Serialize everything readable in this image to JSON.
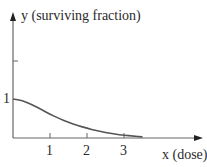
{
  "chart_data": {
    "type": "line",
    "title": "",
    "xlabel": "x (dose)",
    "ylabel": "y (surviving fraction)",
    "x_ticks": [
      "1",
      "2",
      "3"
    ],
    "y_ticks": [
      "1"
    ],
    "xlim": [
      0,
      5.2
    ],
    "ylim": [
      0,
      3.2
    ],
    "grid": false,
    "series": [
      {
        "name": "surviving fraction",
        "x": [
          0,
          0.25,
          0.5,
          0.75,
          1,
          1.25,
          1.5,
          1.75,
          2,
          2.25,
          2.5,
          2.75,
          3,
          3.25,
          3.5
        ],
        "y": [
          1.0,
          0.96,
          0.86,
          0.74,
          0.61,
          0.5,
          0.4,
          0.32,
          0.25,
          0.19,
          0.14,
          0.1,
          0.07,
          0.05,
          0.03
        ]
      }
    ]
  },
  "labels": {
    "y_axis": "y (surviving fraction)",
    "x_axis": "x (dose)",
    "y_tick_1": "1",
    "x_tick_1": "1",
    "x_tick_2": "2",
    "x_tick_3": "3"
  },
  "colors": {
    "axis": "#555555",
    "curve": "#555555",
    "text": "#2a2a2a"
  }
}
